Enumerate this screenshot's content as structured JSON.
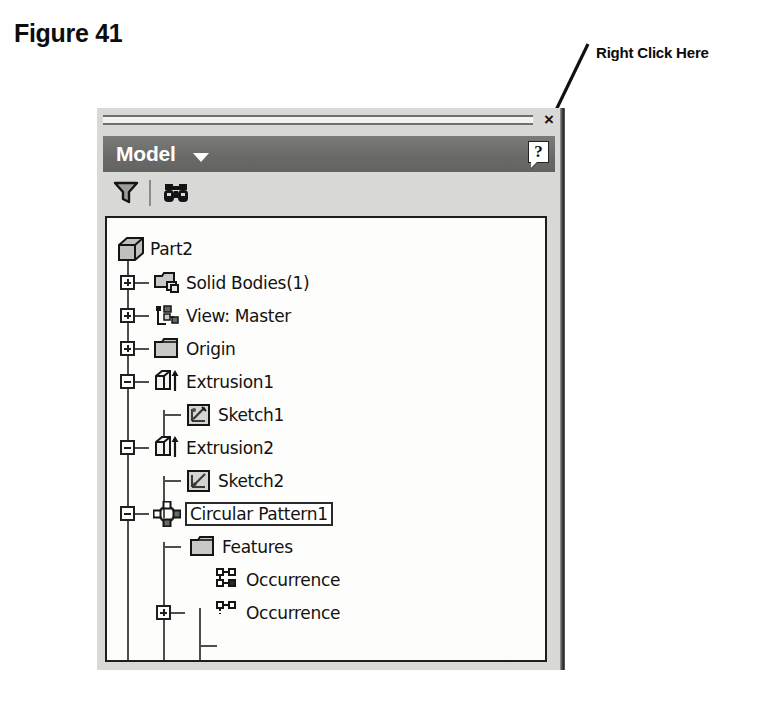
{
  "figure": {
    "label": "Figure 41"
  },
  "callout": {
    "text": "Right Click Here",
    "arrow_target": "Circular Pattern1"
  },
  "panel": {
    "title": "Model",
    "dropdown_caret": "caret-down",
    "close_label": "×",
    "help_label": "?",
    "toolbar": {
      "items": [
        {
          "name": "filter-icon",
          "label": "Filter"
        },
        {
          "name": "binoculars-icon",
          "label": "Search"
        }
      ]
    }
  },
  "tree": {
    "nodes": [
      {
        "label": "Part2",
        "icon": "part-cube-icon",
        "depth": 0,
        "expander": "none",
        "selected": false
      },
      {
        "label": "Solid Bodies(1)",
        "icon": "solid-bodies-icon",
        "depth": 1,
        "expander": "plus",
        "selected": false
      },
      {
        "label": "View: Master",
        "icon": "view-master-icon",
        "depth": 1,
        "expander": "plus",
        "selected": false
      },
      {
        "label": "Origin",
        "icon": "folder-icon",
        "depth": 1,
        "expander": "plus",
        "selected": false
      },
      {
        "label": "Extrusion1",
        "icon": "extrusion-icon",
        "depth": 1,
        "expander": "minus",
        "selected": false
      },
      {
        "label": "Sketch1",
        "icon": "sketch-icon",
        "depth": 2,
        "expander": "none",
        "selected": false
      },
      {
        "label": "Extrusion2",
        "icon": "extrusion-icon",
        "depth": 1,
        "expander": "minus",
        "selected": false
      },
      {
        "label": "Sketch2",
        "icon": "sketch-icon",
        "depth": 2,
        "expander": "none",
        "selected": false
      },
      {
        "label": "Circular Pattern1",
        "icon": "circular-pattern-icon",
        "depth": 1,
        "expander": "minus",
        "selected": true
      },
      {
        "label": "Features",
        "icon": "folder-icon",
        "depth": 2,
        "expander": "plus",
        "selected": false
      },
      {
        "label": "Occurrence",
        "icon": "occurrence-icon",
        "depth": 2,
        "expander": "none",
        "selected": false
      },
      {
        "label": "Occurrence",
        "icon": "occurrence-icon",
        "depth": 2,
        "expander": "none",
        "selected": false
      }
    ]
  },
  "colors": {
    "panel_background": "#dcdcda",
    "title_bar": "#6d6d6b",
    "title_text": "#ffffff",
    "tree_background": "#fdfdfb",
    "text": "#121212",
    "page_background": "#ffffff"
  }
}
